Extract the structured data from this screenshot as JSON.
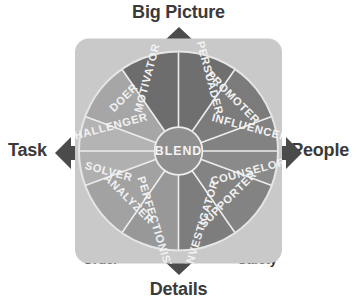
{
  "diagram": {
    "center": {
      "label": "BLEND"
    },
    "axes": {
      "top": "Big Picture",
      "bottom": "Details",
      "left": "Task",
      "right": "People"
    },
    "quadrants": [
      {
        "name": "action",
        "label": "Action",
        "corner": "top-left"
      },
      {
        "name": "people",
        "label": "People",
        "corner": "top-right"
      },
      {
        "name": "order",
        "label": "Order",
        "corner": "bottom-left"
      },
      {
        "name": "safety",
        "label": "Safety",
        "corner": "bottom-right"
      }
    ],
    "segments": [
      {
        "id": "motivator",
        "label": "MOTIVATOR",
        "quadrant": "action",
        "shade": "#6d6d6d"
      },
      {
        "id": "persuader",
        "label": "PERSUADER",
        "quadrant": "people",
        "shade": "#6f6f6f"
      },
      {
        "id": "doer",
        "label": "DOER",
        "quadrant": "action",
        "shade": "#a6a6a6"
      },
      {
        "id": "promoter",
        "label": "PROMOTER",
        "quadrant": "people",
        "shade": "#7b7b7b"
      },
      {
        "id": "challenger",
        "label": "CHALLENGER",
        "quadrant": "action",
        "shade": "#b4b4b4"
      },
      {
        "id": "influencer",
        "label": "INFLUENCER",
        "quadrant": "people",
        "shade": "#828282"
      },
      {
        "id": "solver",
        "label": "SOLVER",
        "quadrant": "order",
        "shade": "#b0b0b0"
      },
      {
        "id": "counselor",
        "label": "COUNSELOR",
        "quadrant": "safety",
        "shade": "#8a8a8a"
      },
      {
        "id": "analyzer",
        "label": "ANALYZER",
        "quadrant": "order",
        "shade": "#a2a2a2"
      },
      {
        "id": "supporter",
        "label": "SUPPORTER",
        "quadrant": "safety",
        "shade": "#838383"
      },
      {
        "id": "perfectionist",
        "label": "PERFECTIONIST",
        "quadrant": "order",
        "shade": "#989898"
      },
      {
        "id": "investigator",
        "label": "INVESTIGATOR",
        "quadrant": "safety",
        "shade": "#7d7d7d"
      }
    ],
    "colors": {
      "panel": "#c9c9c9",
      "panel_edge": "#bdbdbd",
      "arrow": "#4b4b4b",
      "divider": "#ededed",
      "text_dark": "#2e2e2e",
      "text_light": "#f2f2f2",
      "background": "#ffffff"
    }
  }
}
